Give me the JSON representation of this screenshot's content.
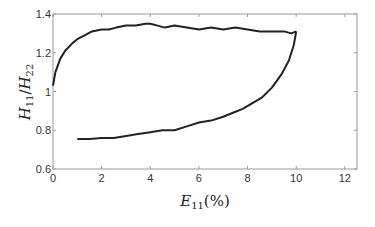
{
  "chart_data": {
    "type": "line",
    "title": "",
    "xlabel": "E_11(%)",
    "ylabel": "H_11/H_22",
    "xlim": [
      0,
      12.5
    ],
    "ylim": [
      0.6,
      1.4
    ],
    "grid": false,
    "legend": null,
    "x_ticks": [
      0,
      2,
      4,
      6,
      8,
      10,
      12
    ],
    "x_tick_labels": [
      "0",
      "2",
      "4",
      "6",
      "8",
      "10",
      "12"
    ],
    "y_ticks": [
      0.6,
      0.8,
      1.0,
      1.2,
      1.4
    ],
    "y_tick_labels": [
      "0.6",
      "0.8",
      "1",
      "1.2",
      "1.4"
    ],
    "series": [
      {
        "name": "loading",
        "color": "#222222",
        "x": [
          0,
          0.1,
          0.3,
          0.5,
          0.8,
          1.0,
          1.3,
          1.6,
          2.0,
          2.3,
          2.6,
          3.0,
          3.4,
          3.8,
          4.0,
          4.3,
          4.6,
          5.0,
          5.5,
          6.0,
          6.5,
          7.0,
          7.5,
          8.0,
          8.5,
          9.0,
          9.5,
          9.8,
          10.0
        ],
        "y": [
          1.03,
          1.1,
          1.17,
          1.21,
          1.25,
          1.27,
          1.29,
          1.31,
          1.32,
          1.32,
          1.33,
          1.34,
          1.34,
          1.35,
          1.35,
          1.34,
          1.33,
          1.34,
          1.33,
          1.32,
          1.33,
          1.32,
          1.33,
          1.32,
          1.31,
          1.31,
          1.31,
          1.3,
          1.31
        ]
      },
      {
        "name": "unloading",
        "color": "#222222",
        "x": [
          10.0,
          9.9,
          9.7,
          9.4,
          9.0,
          8.6,
          8.2,
          7.8,
          7.4,
          7.0,
          6.5,
          6.0,
          5.5,
          5.0,
          4.5,
          4.0,
          3.5,
          3.0,
          2.5,
          2.0,
          1.5,
          1.0
        ],
        "y": [
          1.31,
          1.24,
          1.16,
          1.09,
          1.02,
          0.97,
          0.94,
          0.91,
          0.89,
          0.87,
          0.85,
          0.84,
          0.82,
          0.8,
          0.8,
          0.79,
          0.78,
          0.77,
          0.76,
          0.76,
          0.755,
          0.755
        ]
      }
    ]
  },
  "labels": {
    "xlabel_main": "E",
    "xlabel_sub": "11",
    "xlabel_tail": "(%)",
    "ylabel_num": "H",
    "ylabel_num_sub": "11",
    "ylabel_slash": "/",
    "ylabel_den": "H",
    "ylabel_den_sub": "22"
  }
}
